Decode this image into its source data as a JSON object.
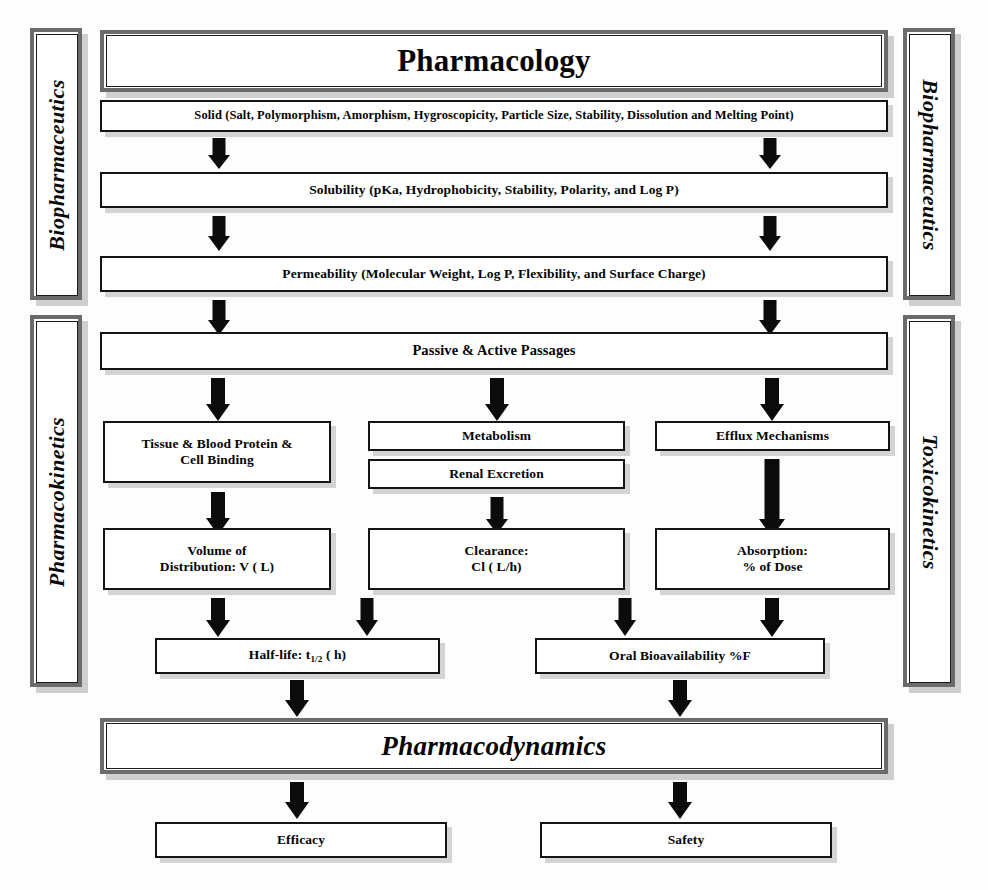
{
  "diagram": {
    "title": "Pharmacology",
    "side_labels": {
      "left_top": "Biopharmaceutics",
      "left_bottom": "Pharmacokinetics",
      "right_top": "Biopharmaceutics",
      "right_bottom": "Toxicokinetics"
    },
    "nodes": {
      "pharmacology": "Pharmacology",
      "solid": "Solid  (Salt, Polymorphism, Amorphism, Hygroscopicity, Particle Size, Stability, Dissolution and Melting Point)",
      "solubility": "Solubility  (pKa, Hydrophobicity, Stability, Polarity, and Log P)",
      "permeability": "Permeability (Molecular Weight, Log P, Flexibility, and Surface Charge)",
      "passages": "Passive & Active Passages",
      "tissue_binding_line1": "Tissue & Blood Protein &",
      "tissue_binding_line2": "Cell Binding",
      "metabolism": "Metabolism",
      "renal_excretion": "Renal Excretion",
      "efflux": "Efflux Mechanisms",
      "volume_line1": "Volume of",
      "volume_line2": "Distribution: V ( L)",
      "clearance_line1": "Clearance:",
      "clearance_line2": "Cl ( L/h)",
      "absorption_line1": "Absorption:",
      "absorption_line2": "% of Dose",
      "halflife_pre": "Half-life: t",
      "halflife_sub": "1/2",
      "halflife_post": " ( h)",
      "oral_bioavailability": "Oral Bioavailability %F",
      "pharmacodynamics": "Pharmacodynamics",
      "efficacy": "Efficacy",
      "safety": "Safety"
    },
    "colors": {
      "box_border": "#141414",
      "heavy_border": "#6b6b6b",
      "arrow": "#0b0b0b",
      "shadow": "#969696",
      "background": "#fdfdfd"
    }
  }
}
